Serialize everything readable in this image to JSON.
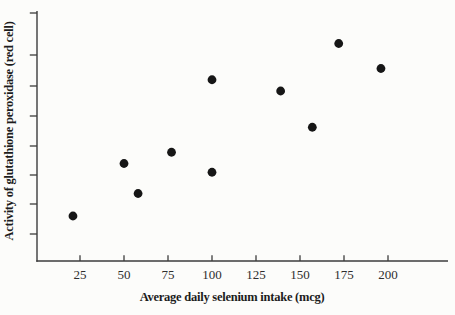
{
  "figure": {
    "background": "#fcfcfa"
  },
  "chart_data": {
    "type": "scatter",
    "title": "",
    "xlabel": "Average daily selenium intake (mcg)",
    "ylabel": "Activity of glutathione peroxidase (red cell)",
    "x_ticks": [
      25,
      50,
      75,
      100,
      125,
      150,
      175,
      200
    ],
    "x_range": [
      0,
      233
    ],
    "y_range": [
      0,
      10
    ],
    "y_units": "arbitrary (y-axis ticks are unlabeled in the figure)",
    "y_ticks": [
      1.08,
      2.28,
      3.44,
      4.6,
      5.8,
      7.0,
      8.24,
      9.92
    ],
    "y_tick_labels_shown": false,
    "grid": false,
    "legend": null,
    "points": [
      {
        "x": 21,
        "y": 1.8
      },
      {
        "x": 50,
        "y": 3.9
      },
      {
        "x": 58,
        "y": 2.7
      },
      {
        "x": 77,
        "y": 4.35
      },
      {
        "x": 100,
        "y": 7.25
      },
      {
        "x": 100,
        "y": 3.55
      },
      {
        "x": 139,
        "y": 6.8
      },
      {
        "x": 157,
        "y": 5.35
      },
      {
        "x": 172,
        "y": 8.7
      },
      {
        "x": 196,
        "y": 7.7
      }
    ],
    "point_color": "#161616",
    "axis_color": "#3c3c3c",
    "text_color": "#2e2e2e"
  }
}
